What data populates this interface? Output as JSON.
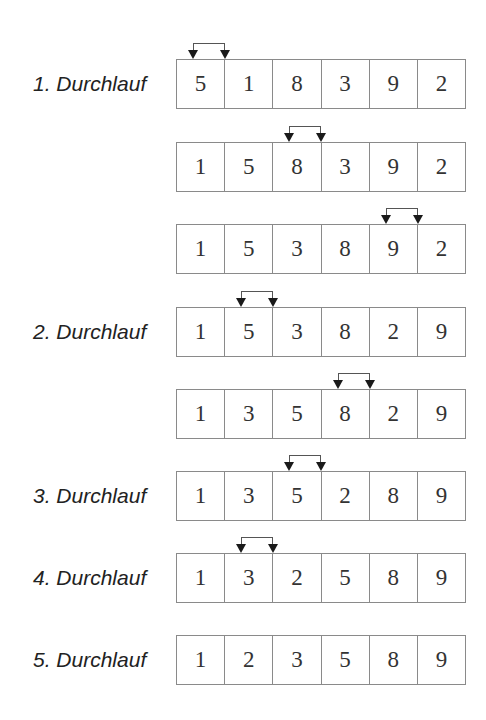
{
  "colors": {
    "border": "#8a8a8a",
    "text": "#333333",
    "arrow": "#1a1a1a"
  },
  "rows": [
    {
      "label": "1. Durchlauf",
      "values": [
        "5",
        "1",
        "8",
        "3",
        "9",
        "2"
      ],
      "swap": [
        0,
        1
      ]
    },
    {
      "label": "",
      "values": [
        "1",
        "5",
        "8",
        "3",
        "9",
        "2"
      ],
      "swap": [
        2,
        3
      ]
    },
    {
      "label": "",
      "values": [
        "1",
        "5",
        "3",
        "8",
        "9",
        "2"
      ],
      "swap": [
        4,
        5
      ]
    },
    {
      "label": "2. Durchlauf",
      "values": [
        "1",
        "5",
        "3",
        "8",
        "2",
        "9"
      ],
      "swap": [
        1,
        2
      ]
    },
    {
      "label": "",
      "values": [
        "1",
        "3",
        "5",
        "8",
        "2",
        "9"
      ],
      "swap": [
        3,
        4
      ]
    },
    {
      "label": "3. Durchlauf",
      "values": [
        "1",
        "3",
        "5",
        "2",
        "8",
        "9"
      ],
      "swap": [
        2,
        3
      ]
    },
    {
      "label": "4. Durchlauf",
      "values": [
        "1",
        "3",
        "2",
        "5",
        "8",
        "9"
      ],
      "swap": [
        1,
        2
      ]
    },
    {
      "label": "5. Durchlauf",
      "values": [
        "1",
        "2",
        "3",
        "5",
        "8",
        "9"
      ],
      "swap": null
    }
  ]
}
